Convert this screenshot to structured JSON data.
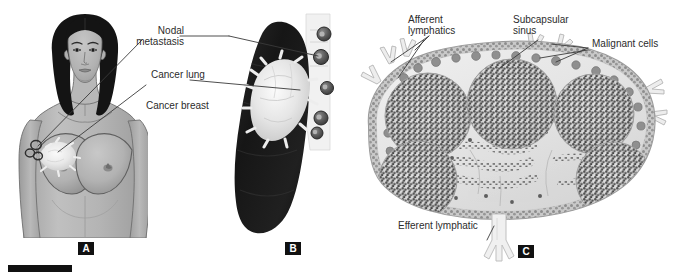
{
  "figure": {
    "kind": "medical-illustration",
    "background_color": "#ffffff",
    "panels": [
      {
        "tag": "A",
        "title": "Cancer breast",
        "description": "Frontal view of a female torso showing a breast carcinoma and axillary nodal metastases",
        "labels": [
          {
            "id": "nodal-metastasis",
            "text": "Nodal\nmetastasis",
            "line1": "Nodal",
            "line2": "metastasis"
          },
          {
            "id": "cancer-breast",
            "text": "Cancer breast",
            "line1": "Cancer breast",
            "line2": ""
          }
        ]
      },
      {
        "tag": "B",
        "title": "Cancer lung",
        "description": "Gross specimen of a lung containing a white tumour mass with adjacent metastatic nodes",
        "labels": [
          {
            "id": "cancer-lung",
            "text": "Cancer lung",
            "line1": "Cancer lung",
            "line2": ""
          }
        ]
      },
      {
        "tag": "C",
        "title": "Lymph node with metastatic deposits",
        "description": "Cross-section of a lymph node showing follicles, subcapsular sinus infiltrated by malignant cells, afferent and efferent lymphatics",
        "labels": [
          {
            "id": "afferent-lymphatics",
            "text": "Afferent\nlymphatics",
            "line1": "Afferent",
            "line2": "lymphatics"
          },
          {
            "id": "subcapsular-sinus",
            "text": "Subcapsular\nsinus",
            "line1": "Subcapsular",
            "line2": "sinus"
          },
          {
            "id": "malignant-cells",
            "text": "Malignant cells",
            "line1": "Malignant cells",
            "line2": ""
          },
          {
            "id": "efferent-lymphatic",
            "text": "Efferent lymphatic",
            "line1": "Efferent lymphatic",
            "line2": ""
          }
        ]
      }
    ],
    "panel_tags": {
      "a": "A",
      "b": "B",
      "c": "C"
    },
    "colors": {
      "ink": "#2c2c2c",
      "tag_background": "#111111",
      "tag_text": "#ffffff",
      "skin": "#b6b6b6",
      "skin_shadow": "#9a9a9a",
      "hair": "#141414",
      "tumor": "#f2f2f2",
      "lung": "#1e1e1e",
      "node_fill": "#e9e9e9",
      "node_outline": "#8e8e8e",
      "follicle_cell": "#5a5a5a",
      "malignant_cell": "#7a7a7a",
      "leader_line": "#3a3a3a",
      "scale_bar": "#111111"
    },
    "scale_bar": {
      "present": true,
      "color": "#111111"
    }
  }
}
